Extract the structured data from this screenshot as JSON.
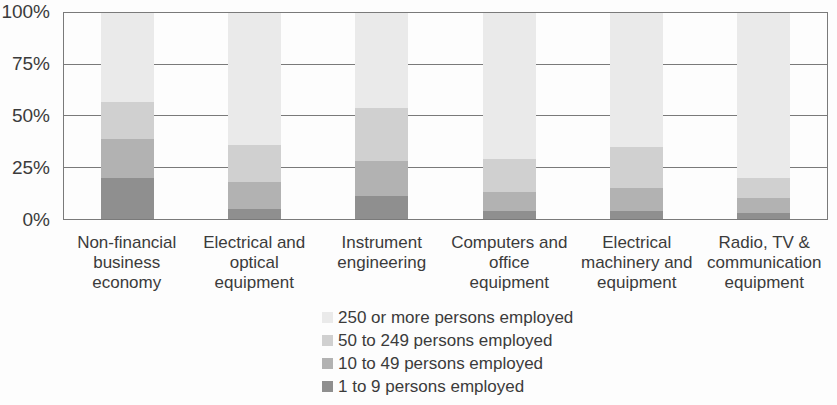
{
  "chart_data": {
    "type": "bar",
    "stacked": true,
    "units": "percent share of employment",
    "title": "",
    "categories": [
      "Non-financial business economy",
      "Electrical and optical equipment",
      "Instrument engineering",
      "Computers and office equipment",
      "Electrical machinery and equipment",
      "Radio, TV & communication equipment"
    ],
    "category_label_lines": [
      [
        "Non-financial",
        "business",
        "economy"
      ],
      [
        "Electrical and",
        "optical",
        "equipment"
      ],
      [
        "Instrument",
        "engineering"
      ],
      [
        "Computers and",
        "office equipment"
      ],
      [
        "Electrical",
        "machinery and",
        "equipment"
      ],
      [
        "Radio, TV &",
        "communication",
        "equipment"
      ]
    ],
    "series": [
      {
        "name": "1 to 9 persons employed",
        "color": "#8f8f8f",
        "values": [
          20,
          5,
          11,
          4,
          4,
          3
        ]
      },
      {
        "name": "10 to 49 persons employed",
        "color": "#b2b2b2",
        "values": [
          19,
          13,
          17,
          9,
          11,
          7
        ]
      },
      {
        "name": "50 to 249 persons employed",
        "color": "#d0d0d0",
        "values": [
          18,
          18,
          26,
          16,
          20,
          10
        ]
      },
      {
        "name": "250 or more persons employed",
        "color": "#eaeaea",
        "values": [
          43,
          64,
          46,
          71,
          65,
          80
        ]
      }
    ],
    "y_axis": {
      "ticks": [
        {
          "label": "100%",
          "value": 100
        },
        {
          "label": "75%",
          "value": 75
        },
        {
          "label": "50%",
          "value": 50
        },
        {
          "label": "25%",
          "value": 25
        },
        {
          "label": "0%",
          "value": 0
        }
      ],
      "gridlines": [
        75,
        50,
        25
      ]
    },
    "ylim": [
      0,
      100
    ],
    "grid": "horizontal",
    "legend_position": "bottom-center",
    "legend_order": "largest-size-class-first",
    "style": {
      "axis_color": "#7a7a7a",
      "text_color": "#3b3b3b",
      "background": "#fdfdfd"
    }
  }
}
